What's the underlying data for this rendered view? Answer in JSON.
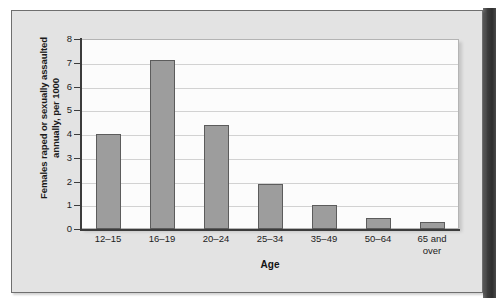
{
  "figure": {
    "background_color": "#e3e3e3",
    "plot_background_color": "#fcfcfc",
    "bar_fill_color": "#9d9d9d",
    "bar_border_color": "#5c5c5c",
    "axis_color": "#3c3c3c",
    "gridline_color": "#d2d2d2",
    "spine_color": "#3d3d3d"
  },
  "chart_data": {
    "type": "bar",
    "title": "",
    "xlabel": "Age",
    "ylabel": "Females raped or sexually assaulted annually, per 1000",
    "ylabel_line1": "Females raped or sexually assaulted",
    "ylabel_line2": "annually, per 1000",
    "categories": [
      "12–15",
      "16–19",
      "20–24",
      "25–34",
      "35–49",
      "50–64",
      "65 and over"
    ],
    "category_lines": [
      [
        "12–15"
      ],
      [
        "16–19"
      ],
      [
        "20–24"
      ],
      [
        "25–34"
      ],
      [
        "35–49"
      ],
      [
        "50–64"
      ],
      [
        "65 and",
        "over"
      ]
    ],
    "values": [
      4.0,
      7.1,
      4.4,
      1.9,
      1.0,
      0.45,
      0.3
    ],
    "ylim": [
      0,
      8
    ],
    "yticks": [
      0,
      1,
      2,
      3,
      4,
      5,
      6,
      7,
      8
    ],
    "ytick_labels": [
      "0",
      "1",
      "2",
      "3",
      "4",
      "5",
      "6",
      "7",
      "8"
    ],
    "grid": true,
    "grid_axis": "y",
    "legend": false,
    "legend_position": "none"
  }
}
